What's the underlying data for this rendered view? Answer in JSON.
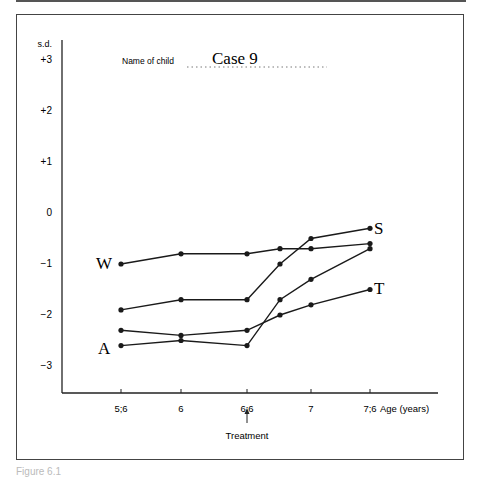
{
  "figure": {
    "name_label": "Name of child",
    "case_name": "Case 9",
    "caption": "Figure 6.1",
    "treatment_label": "Treatment",
    "treatment_at": "6;6"
  },
  "chart_data": {
    "type": "line",
    "title": "Case 9",
    "xlabel": "Age (years)",
    "ylabel": "s.d.",
    "x": [
      "5;6",
      "6",
      "6;6",
      "6;9",
      "7",
      "7;6"
    ],
    "x_tick_labels": [
      "5;6",
      "6",
      "6;6",
      "7",
      "7;6"
    ],
    "y_tick_labels": [
      "+3",
      "+2",
      "+1",
      "0",
      "−1",
      "−2",
      "−3"
    ],
    "ylim": [
      -3.5,
      3.3
    ],
    "grid": false,
    "annotations": [
      {
        "text": "Treatment",
        "x": "6;6",
        "type": "arrow"
      }
    ],
    "series": [
      {
        "name": "W",
        "values": [
          -1.0,
          -0.8,
          -0.8,
          -0.7,
          -0.7,
          -0.6
        ]
      },
      {
        "name": "S",
        "values": [
          -1.9,
          -1.7,
          -1.7,
          -1.0,
          -0.5,
          -0.3
        ]
      },
      {
        "name": "A",
        "values": [
          -2.6,
          -2.5,
          -2.6,
          -1.7,
          -1.3,
          -0.7
        ]
      },
      {
        "name": "T",
        "values": [
          -2.3,
          -2.4,
          -2.3,
          -2.0,
          -1.8,
          -1.5
        ]
      }
    ]
  }
}
